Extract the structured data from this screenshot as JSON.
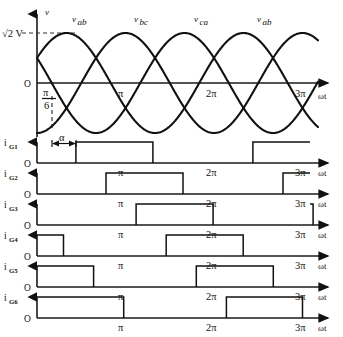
{
  "figure": {
    "type": "waveform-timing-diagram"
  },
  "voltage_plot": {
    "y_axis_label": "v",
    "origin_label": "O",
    "peak_label": "√2 V",
    "x_axis_label": "ωt",
    "firing_delay_label": "α",
    "reference_angle_label_num": "π",
    "reference_angle_label_den": "6",
    "x_ticks": [
      {
        "label": "π",
        "x": 124
      },
      {
        "label": "2π",
        "x": 212
      },
      {
        "label": "3π",
        "x": 301
      }
    ],
    "wave_labels": [
      {
        "text": "v",
        "sub": "ab",
        "x": 72
      },
      {
        "text": "v",
        "sub": "bc",
        "x": 134
      },
      {
        "text": "v",
        "sub": "ca",
        "x": 194
      },
      {
        "text": "v",
        "sub": "ab",
        "x": 257
      }
    ]
  },
  "chart_data": {
    "type": "line",
    "xlabel": "ωt",
    "ylabel": "v",
    "xlim": [
      0,
      3.3
    ],
    "x_unit": "pi radians",
    "grid": false,
    "legend": "inline-labels",
    "series": [
      {
        "name": "v_ab",
        "form": "sin(wt + pi/6)",
        "amplitude": "sqrt(2) V",
        "phase_deg": 30
      },
      {
        "name": "v_bc",
        "form": "sin(wt - pi/2)",
        "amplitude": "sqrt(2) V",
        "phase_deg": -90
      },
      {
        "name": "v_ca",
        "form": "sin(wt + 5pi/6)",
        "amplitude": "sqrt(2) V",
        "phase_deg": 150
      }
    ],
    "gate_pulses": {
      "unit": "pi radians",
      "pulse_width_pi": 0.875,
      "firing_delay_alpha_pi": 0.27,
      "rows": [
        {
          "name": "i_G1",
          "label": "i",
          "sub": "G1",
          "intervals": [
            [
              0.44,
              1.31
            ],
            [
              2.44,
              3.3
            ]
          ]
        },
        {
          "name": "i_G2",
          "label": "i",
          "sub": "G2",
          "intervals": [
            [
              0.78,
              1.65
            ],
            [
              2.78,
              3.3
            ]
          ]
        },
        {
          "name": "i_G3",
          "label": "i",
          "sub": "G3",
          "intervals": [
            [
              1.12,
              1.99
            ],
            [
              3.12,
              3.3
            ]
          ]
        },
        {
          "name": "i_G4",
          "label": "i",
          "sub": "G4",
          "intervals": [
            [
              0.0,
              0.3
            ],
            [
              1.46,
              2.33
            ]
          ]
        },
        {
          "name": "i_G5",
          "label": "i",
          "sub": "G5",
          "intervals": [
            [
              0.0,
              0.64
            ],
            [
              1.8,
              2.67
            ]
          ]
        },
        {
          "name": "i_G6",
          "label": "i",
          "sub": "G6",
          "intervals": [
            [
              0.0,
              0.98
            ],
            [
              2.14,
              3.0
            ]
          ]
        }
      ]
    }
  },
  "gate_rows": [
    {
      "label": "i",
      "sub": "G1",
      "origin": "O",
      "axis_label": "ωt",
      "ticks": [
        {
          "label": "π",
          "x": 124
        },
        {
          "label": "2π",
          "x": 212
        },
        {
          "label": "3π",
          "x": 301
        }
      ]
    },
    {
      "label": "i",
      "sub": "G2",
      "origin": "O",
      "axis_label": "ωt",
      "ticks": [
        {
          "label": "π",
          "x": 124
        },
        {
          "label": "2π",
          "x": 212
        },
        {
          "label": "3π",
          "x": 301
        }
      ]
    },
    {
      "label": "i",
      "sub": "G3",
      "origin": "O",
      "axis_label": "ωt",
      "ticks": [
        {
          "label": "π",
          "x": 124
        },
        {
          "label": "2π",
          "x": 212
        },
        {
          "label": "3π",
          "x": 301
        }
      ]
    },
    {
      "label": "i",
      "sub": "G4",
      "origin": "O",
      "axis_label": "ωt",
      "ticks": [
        {
          "label": "π",
          "x": 124
        },
        {
          "label": "2π",
          "x": 212
        },
        {
          "label": "3π",
          "x": 301
        }
      ]
    },
    {
      "label": "i",
      "sub": "G5",
      "origin": "O",
      "axis_label": "ωt",
      "ticks": [
        {
          "label": "π",
          "x": 124
        },
        {
          "label": "2π",
          "x": 212
        },
        {
          "label": "3π",
          "x": 301
        }
      ]
    },
    {
      "label": "i",
      "sub": "G6",
      "origin": "O",
      "axis_label": "ωt",
      "ticks": [
        {
          "label": "π",
          "x": 124
        },
        {
          "label": "2π",
          "x": 212
        },
        {
          "label": "3π",
          "x": 301
        }
      ]
    }
  ],
  "colors": {
    "ink": "#111111",
    "paper": "#ffffff",
    "dash": "#333333"
  }
}
